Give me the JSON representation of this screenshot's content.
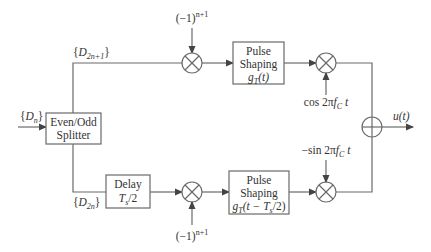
{
  "diagram": {
    "input_label": {
      "open": "{",
      "sym": "D",
      "sub": "n",
      "close": "}"
    },
    "splitter": {
      "line1": "Even/Odd",
      "line2": "Splitter"
    },
    "odd_label": {
      "open": "{",
      "sym": "D",
      "sub": "2n+1",
      "close": "}"
    },
    "even_label": {
      "open": "{",
      "sym": "D",
      "sub": "2n",
      "close": "}"
    },
    "top_sign": {
      "base": "(−1)",
      "exp": "n+1"
    },
    "bottom_sign": {
      "base": "(−1)",
      "exp": "n+1"
    },
    "delay": {
      "line1": "Delay",
      "sym": "T",
      "sub": "s",
      "rest": "/2"
    },
    "pulse_top": {
      "line1": "Pulse",
      "line2": "Shaping",
      "g": "g",
      "sub": "T",
      "arg": "(t)"
    },
    "pulse_bottom": {
      "line1": "Pulse",
      "line2": "Shaping",
      "g": "g",
      "sub": "T",
      "arg": "(t − T",
      "argsub": "s",
      "argend": "/2)"
    },
    "carrier_top": {
      "pre": "cos 2π",
      "f": "f",
      "sub": "C",
      "t": "t"
    },
    "carrier_bottom": {
      "pre": "−sin 2π",
      "f": "f",
      "sub": "C",
      "t": "t"
    },
    "output_label": "u(t)"
  }
}
